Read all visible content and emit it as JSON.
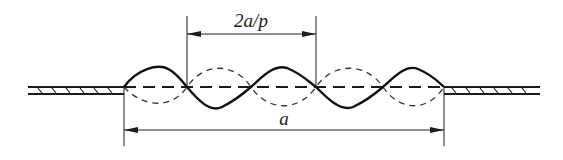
{
  "diagram": {
    "title": "",
    "labels": {
      "half_wave_dimension": "2a/p",
      "span_dimension": "a"
    },
    "elements": [
      {
        "name": "left-support-plate",
        "type": "hatched-bar"
      },
      {
        "name": "right-support-plate",
        "type": "hatched-bar"
      },
      {
        "name": "buckled-mode-solid",
        "type": "sine-curve",
        "half_waves": 5
      },
      {
        "name": "buckled-mode-dashed",
        "type": "sine-curve",
        "half_waves": 5
      },
      {
        "name": "centerline",
        "type": "dashed-line"
      }
    ],
    "colors": {
      "stroke": "#1a1a1a",
      "background": "#ffffff"
    }
  }
}
